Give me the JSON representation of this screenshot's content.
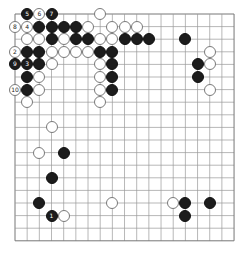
{
  "board": {
    "size": 19,
    "origin_x": 15,
    "origin_y": 14,
    "spacing_x": 12.17,
    "spacing_y": 12.6,
    "line_color": "#9a9a9a",
    "edge_color": "#777777"
  },
  "stones": [
    {
      "color": "black",
      "col": 1,
      "row": 0,
      "label": "5"
    },
    {
      "color": "white",
      "col": 2,
      "row": 0,
      "label": "6"
    },
    {
      "color": "black",
      "col": 3,
      "row": 0,
      "label": "7"
    },
    {
      "color": "white",
      "col": 7,
      "row": 0,
      "label": ""
    },
    {
      "color": "white",
      "col": 0,
      "row": 1,
      "label": "8"
    },
    {
      "color": "white",
      "col": 1,
      "row": 1,
      "label": "4"
    },
    {
      "color": "black",
      "col": 2,
      "row": 1,
      "label": ""
    },
    {
      "color": "black",
      "col": 3,
      "row": 1,
      "label": ""
    },
    {
      "color": "black",
      "col": 4,
      "row": 1,
      "label": ""
    },
    {
      "color": "black",
      "col": 5,
      "row": 1,
      "label": ""
    },
    {
      "color": "white",
      "col": 6,
      "row": 1,
      "label": ""
    },
    {
      "color": "white",
      "col": 8,
      "row": 1,
      "label": ""
    },
    {
      "color": "white",
      "col": 9,
      "row": 1,
      "label": ""
    },
    {
      "color": "white",
      "col": 10,
      "row": 1,
      "label": ""
    },
    {
      "color": "white",
      "col": 1,
      "row": 2,
      "label": ""
    },
    {
      "color": "white",
      "col": 2,
      "row": 2,
      "label": ""
    },
    {
      "color": "black",
      "col": 3,
      "row": 2,
      "label": ""
    },
    {
      "color": "white",
      "col": 4,
      "row": 2,
      "label": ""
    },
    {
      "color": "black",
      "col": 5,
      "row": 2,
      "label": ""
    },
    {
      "color": "black",
      "col": 6,
      "row": 2,
      "label": ""
    },
    {
      "color": "white",
      "col": 7,
      "row": 2,
      "label": ""
    },
    {
      "color": "white",
      "col": 8,
      "row": 2,
      "label": ""
    },
    {
      "color": "black",
      "col": 9,
      "row": 2,
      "label": ""
    },
    {
      "color": "black",
      "col": 10,
      "row": 2,
      "label": ""
    },
    {
      "color": "black",
      "col": 11,
      "row": 2,
      "label": ""
    },
    {
      "color": "black",
      "col": 14,
      "row": 2,
      "label": ""
    },
    {
      "color": "white",
      "col": 0,
      "row": 3,
      "label": "2"
    },
    {
      "color": "black",
      "col": 1,
      "row": 3,
      "label": ""
    },
    {
      "color": "black",
      "col": 2,
      "row": 3,
      "label": ""
    },
    {
      "color": "white",
      "col": 3,
      "row": 3,
      "label": ""
    },
    {
      "color": "white",
      "col": 4,
      "row": 3,
      "label": ""
    },
    {
      "color": "white",
      "col": 5,
      "row": 3,
      "label": ""
    },
    {
      "color": "white",
      "col": 6,
      "row": 3,
      "label": ""
    },
    {
      "color": "black",
      "col": 7,
      "row": 3,
      "label": ""
    },
    {
      "color": "black",
      "col": 8,
      "row": 3,
      "label": ""
    },
    {
      "color": "white",
      "col": 16,
      "row": 3,
      "label": ""
    },
    {
      "color": "black",
      "col": 0,
      "row": 4,
      "label": "9"
    },
    {
      "color": "black",
      "col": 1,
      "row": 4,
      "label": "3"
    },
    {
      "color": "black",
      "col": 2,
      "row": 4,
      "label": ""
    },
    {
      "color": "white",
      "col": 3,
      "row": 4,
      "label": ""
    },
    {
      "color": "white",
      "col": 7,
      "row": 4,
      "label": ""
    },
    {
      "color": "black",
      "col": 8,
      "row": 4,
      "label": ""
    },
    {
      "color": "black",
      "col": 15,
      "row": 4,
      "label": ""
    },
    {
      "color": "white",
      "col": 16,
      "row": 4,
      "label": ""
    },
    {
      "color": "black",
      "col": 1,
      "row": 5,
      "label": ""
    },
    {
      "color": "white",
      "col": 2,
      "row": 5,
      "label": ""
    },
    {
      "color": "white",
      "col": 7,
      "row": 5,
      "label": ""
    },
    {
      "color": "black",
      "col": 8,
      "row": 5,
      "label": ""
    },
    {
      "color": "black",
      "col": 15,
      "row": 5,
      "label": ""
    },
    {
      "color": "white",
      "col": 0,
      "row": 6,
      "label": "10"
    },
    {
      "color": "black",
      "col": 1,
      "row": 6,
      "label": ""
    },
    {
      "color": "white",
      "col": 2,
      "row": 6,
      "label": ""
    },
    {
      "color": "white",
      "col": 7,
      "row": 6,
      "label": ""
    },
    {
      "color": "black",
      "col": 8,
      "row": 6,
      "label": ""
    },
    {
      "color": "white",
      "col": 16,
      "row": 6,
      "label": ""
    },
    {
      "color": "white",
      "col": 1,
      "row": 7,
      "label": ""
    },
    {
      "color": "white",
      "col": 7,
      "row": 7,
      "label": ""
    },
    {
      "color": "white",
      "col": 3,
      "row": 9,
      "label": ""
    },
    {
      "color": "white",
      "col": 2,
      "row": 11,
      "label": ""
    },
    {
      "color": "black",
      "col": 4,
      "row": 11,
      "label": ""
    },
    {
      "color": "black",
      "col": 3,
      "row": 13,
      "label": ""
    },
    {
      "color": "black",
      "col": 2,
      "row": 15,
      "label": ""
    },
    {
      "color": "white",
      "col": 8,
      "row": 15,
      "label": ""
    },
    {
      "color": "white",
      "col": 13,
      "row": 15,
      "label": ""
    },
    {
      "color": "black",
      "col": 14,
      "row": 15,
      "label": ""
    },
    {
      "color": "black",
      "col": 16,
      "row": 15,
      "label": ""
    },
    {
      "color": "black",
      "col": 3,
      "row": 16,
      "label": "1"
    },
    {
      "color": "white",
      "col": 4,
      "row": 16,
      "label": ""
    },
    {
      "color": "black",
      "col": 14,
      "row": 16,
      "label": ""
    }
  ]
}
